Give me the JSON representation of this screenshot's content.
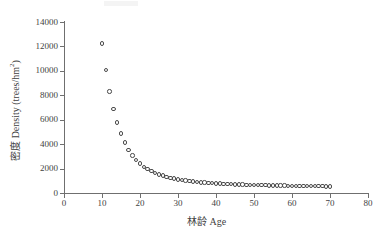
{
  "chart": {
    "title": "",
    "x_axis_title": "林龄  Age",
    "y_axis_title_cn": "密度 Density (trees/hm",
    "y_axis_title_sup": "2",
    "y_axis_title_tail": ")",
    "marker_color": "#4a4a4a",
    "axis_color": "#6f6f6f"
  },
  "chart_data": {
    "type": "scatter",
    "title": "",
    "xlabel": "林龄  Age",
    "ylabel": "密度 Density (trees/hm2)",
    "xlim": [
      0,
      80
    ],
    "ylim": [
      0,
      14000
    ],
    "xticks": [
      0,
      10,
      20,
      30,
      40,
      50,
      60,
      70,
      80
    ],
    "yticks": [
      0,
      2000,
      4000,
      6000,
      8000,
      10000,
      12000,
      14000
    ],
    "grid": false,
    "legend": null,
    "series": [
      {
        "name": "Stand density",
        "marker": "open-circle",
        "x": [
          10,
          11,
          12,
          13,
          14,
          15,
          16,
          17,
          18,
          19,
          20,
          21,
          22,
          23,
          24,
          25,
          26,
          27,
          28,
          29,
          30,
          31,
          32,
          33,
          34,
          35,
          36,
          37,
          38,
          39,
          40,
          41,
          42,
          43,
          44,
          45,
          46,
          47,
          48,
          49,
          50,
          51,
          52,
          53,
          54,
          55,
          56,
          57,
          58,
          59,
          60,
          61,
          62,
          63,
          64,
          65,
          66,
          67,
          68,
          69,
          70
        ],
        "y": [
          12250,
          10050,
          8320,
          6900,
          5780,
          4860,
          4120,
          3520,
          3060,
          2700,
          2400,
          2150,
          1950,
          1780,
          1640,
          1520,
          1420,
          1330,
          1250,
          1180,
          1120,
          1070,
          1020,
          980,
          940,
          905,
          875,
          850,
          825,
          805,
          785,
          765,
          750,
          735,
          720,
          710,
          695,
          685,
          675,
          665,
          655,
          648,
          640,
          632,
          625,
          618,
          612,
          605,
          600,
          594,
          588,
          583,
          578,
          573,
          568,
          564,
          560,
          556,
          552,
          548,
          545
        ]
      }
    ]
  }
}
